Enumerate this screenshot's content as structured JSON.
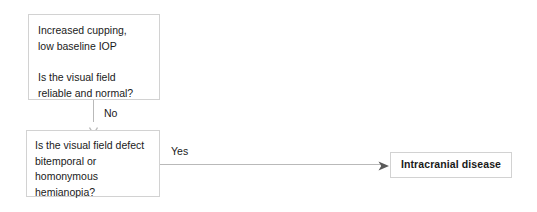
{
  "diagram": {
    "background_color": "#ffffff",
    "border_color": "#d2d2d2",
    "connector_color": "#b9b9b9",
    "text_color": "#1a1a1a"
  },
  "nodes": {
    "presentation": {
      "text": "Increased cupping,\nlow baseline IOP\n\nIs the visual field\nreliable and normal?",
      "line1": "Increased cupping,",
      "line2": "low baseline IOP",
      "line3": "Is the visual field",
      "line4": "reliable and normal?"
    },
    "field_defect": {
      "text": "Is the visual field defect\nbitemporal or\nhomonymous\nhemianopia?",
      "line1": "Is the visual field defect",
      "line2": "bitemporal or",
      "line3": "homonymous",
      "line4": "hemianopia?"
    },
    "intracranial": {
      "text": "Intracranial disease"
    }
  },
  "edges": {
    "no_branch": {
      "label": "No",
      "from": "presentation",
      "to": "field_defect",
      "arrowhead": "chevron-down-arrowhead"
    },
    "yes_branch": {
      "label": "Yes",
      "from": "field_defect",
      "to": "intracranial",
      "arrowhead": "triangle-right-arrowhead"
    }
  }
}
